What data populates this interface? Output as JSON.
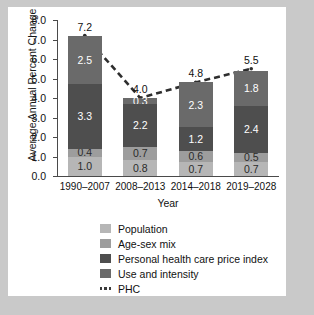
{
  "chart_data": {
    "type": "bar",
    "stacked": true,
    "title": "",
    "xlabel": "Year",
    "ylabel": "Average Annual Percent Change",
    "categories": [
      "1990–2007",
      "2008–2013",
      "2014–2018",
      "2019–2028"
    ],
    "ylim": [
      0.0,
      8.0
    ],
    "yticks": [
      "0.0",
      "1.0",
      "2.0",
      "3.0",
      "4.0",
      "5.0",
      "6.0",
      "7.0",
      "8.0"
    ],
    "grid": false,
    "legend_position": "bottom",
    "series": [
      {
        "name": "Population",
        "color": "#b6b6b6",
        "values": [
          1.0,
          0.8,
          0.7,
          0.7
        ],
        "labels": [
          "1.0",
          "0.8",
          "0.7",
          "0.7"
        ]
      },
      {
        "name": "Age-sex mix",
        "color": "#9d9d9d",
        "values": [
          0.4,
          0.7,
          0.6,
          0.5
        ],
        "labels": [
          "0.4",
          "0.7",
          "0.6",
          "0.5"
        ]
      },
      {
        "name": "Personal health care price index",
        "color": "#4e4e4e",
        "values": [
          3.3,
          2.2,
          1.2,
          2.4
        ],
        "labels": [
          "3.3",
          "2.2",
          "1.2",
          "2.4"
        ]
      },
      {
        "name": "Use and intensity",
        "color": "#6a6a6a",
        "values": [
          2.5,
          0.3,
          2.3,
          1.8
        ],
        "labels": [
          "2.5",
          "0.3",
          "2.3",
          "1.8"
        ]
      }
    ],
    "overlay_line": {
      "name": "PHC",
      "style": "dashed",
      "color": "#2e2e2e",
      "values": [
        7.2,
        4.0,
        4.8,
        5.5
      ],
      "labels": [
        "7.2",
        "4.0",
        "4.8",
        "5.5"
      ]
    }
  },
  "legend": {
    "items": [
      {
        "label": "Population",
        "swatch": "#b6b6b6",
        "kind": "box"
      },
      {
        "label": "Age-sex mix",
        "swatch": "#9d9d9d",
        "kind": "box"
      },
      {
        "label": "Personal health care price index",
        "swatch": "#4e4e4e",
        "kind": "box"
      },
      {
        "label": "Use and intensity",
        "swatch": "#6a6a6a",
        "kind": "box"
      },
      {
        "label": "PHC",
        "swatch": "#3b3b3b",
        "kind": "dots"
      }
    ]
  }
}
